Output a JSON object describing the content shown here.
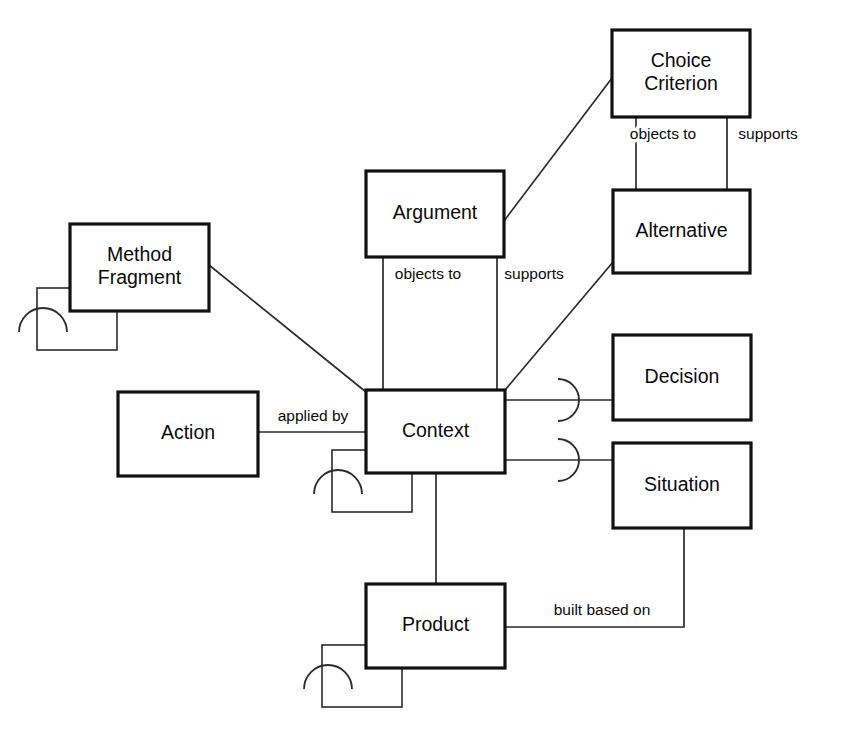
{
  "diagram": {
    "type": "entity-relationship-diagram",
    "notation": "NIAM/ORM-style boxes with role-arc cardinality markers",
    "colors": {
      "background": "#ffffff",
      "box_stroke": "#111111",
      "line_stroke": "#2b2b2b",
      "text": "#0a0a0a"
    },
    "entities": [
      {
        "id": "choice_criterion",
        "label": "Choice Criterion",
        "label_lines": [
          "Choice",
          "Criterion"
        ],
        "x": 612,
        "y": 30,
        "w": 138,
        "h": 87,
        "self_loop": false
      },
      {
        "id": "argument",
        "label": "Argument",
        "label_lines": [
          "Argument"
        ],
        "x": 366,
        "y": 171,
        "w": 138,
        "h": 86,
        "self_loop": false
      },
      {
        "id": "alternative",
        "label": "Alternative",
        "label_lines": [
          "Alternative"
        ],
        "x": 613,
        "y": 190,
        "w": 137,
        "h": 83,
        "self_loop": false
      },
      {
        "id": "method_fragment",
        "label": "Method Fragment",
        "label_lines": [
          "Method",
          "Fragment"
        ],
        "x": 70,
        "y": 224,
        "w": 139,
        "h": 87,
        "self_loop": true
      },
      {
        "id": "decision",
        "label": "Decision",
        "label_lines": [
          "Decision"
        ],
        "x": 613,
        "y": 335,
        "w": 138,
        "h": 85,
        "self_loop": false
      },
      {
        "id": "context",
        "label": "Context",
        "label_lines": [
          "Context"
        ],
        "x": 366,
        "y": 390,
        "w": 139,
        "h": 83,
        "self_loop": true
      },
      {
        "id": "action",
        "label": "Action",
        "label_lines": [
          "Action"
        ],
        "x": 118,
        "y": 392,
        "w": 140,
        "h": 84,
        "self_loop": false
      },
      {
        "id": "situation",
        "label": "Situation",
        "label_lines": [
          "Situation"
        ],
        "x": 613,
        "y": 443,
        "w": 138,
        "h": 85,
        "self_loop": false
      },
      {
        "id": "product",
        "label": "Product",
        "label_lines": [
          "Product"
        ],
        "x": 366,
        "y": 584,
        "w": 139,
        "h": 84,
        "self_loop": true
      }
    ],
    "relationships": [
      {
        "id": "cc-objects-to-alt",
        "from": "choice_criterion",
        "to": "alternative",
        "label": "objects to",
        "label_x": 663,
        "label_y": 135,
        "path": "M 636 117 L 636 190"
      },
      {
        "id": "cc-supports-alt",
        "from": "choice_criterion",
        "to": "alternative",
        "label": "supports",
        "label_x": 768,
        "label_y": 135,
        "path": "M 727 117 L 727 190"
      },
      {
        "id": "argument-cc",
        "from": "argument",
        "to": "choice_criterion",
        "label": "",
        "label_x": 0,
        "label_y": 0,
        "path": "M 504 221 L 612 78"
      },
      {
        "id": "argument-objects-to-context",
        "from": "argument",
        "to": "context",
        "label": "objects to",
        "label_x": 428,
        "label_y": 275,
        "path": "M 383 257 L 383 390"
      },
      {
        "id": "argument-supports-context",
        "from": "argument",
        "to": "context",
        "label": "supports",
        "label_x": 534,
        "label_y": 275,
        "path": "M 497 257 L 497 390"
      },
      {
        "id": "alternative-context",
        "from": "alternative",
        "to": "context",
        "label": "",
        "label_x": 0,
        "label_y": 0,
        "path": "M 613 262 L 505 390"
      },
      {
        "id": "method-fragment-context",
        "from": "method_fragment",
        "to": "context",
        "label": "",
        "label_x": 0,
        "label_y": 0,
        "path": "M 209 265 L 366 392"
      },
      {
        "id": "action-applied-by-context",
        "from": "action",
        "to": "context",
        "label": "applied by",
        "label_x": 313,
        "label_y": 417,
        "path": "M 258 432 L 366 432"
      },
      {
        "id": "context-decision",
        "from": "context",
        "to": "decision",
        "label": "",
        "label_x": 0,
        "label_y": 0,
        "path": "M 505 400 L 613 400",
        "cardinality_arc": {
          "cx": 558,
          "cy": 400,
          "r": 21,
          "side": "right"
        }
      },
      {
        "id": "context-situation",
        "from": "context",
        "to": "situation",
        "label": "",
        "label_x": 0,
        "label_y": 0,
        "path": "M 505 460 L 613 460",
        "cardinality_arc": {
          "cx": 558,
          "cy": 460,
          "r": 21,
          "side": "right"
        }
      },
      {
        "id": "context-product",
        "from": "context",
        "to": "product",
        "label": "",
        "label_x": 0,
        "label_y": 0,
        "path": "M 436 473 L 436 584"
      },
      {
        "id": "product-built-based-on-situation",
        "from": "product",
        "to": "situation",
        "label": "built based on",
        "label_x": 602,
        "label_y": 611,
        "path": "M 505 627 L 684 627 L 684 528"
      }
    ],
    "self_loops": [
      {
        "id": "method-fragment-self-loop",
        "entity": "method_fragment",
        "box_x": 37,
        "box_y": 288,
        "box_w": 80,
        "box_h": 62,
        "arc_cx": 43,
        "arc_cy": 320,
        "arc_r": 24
      },
      {
        "id": "context-self-loop",
        "entity": "context",
        "box_x": 332,
        "box_y": 450,
        "box_w": 80,
        "box_h": 62,
        "arc_cx": 338,
        "arc_cy": 482,
        "arc_r": 24
      },
      {
        "id": "product-self-loop",
        "entity": "product",
        "box_x": 322,
        "box_y": 645,
        "box_w": 80,
        "box_h": 62,
        "arc_cx": 328,
        "arc_cy": 677,
        "arc_r": 24
      }
    ]
  }
}
